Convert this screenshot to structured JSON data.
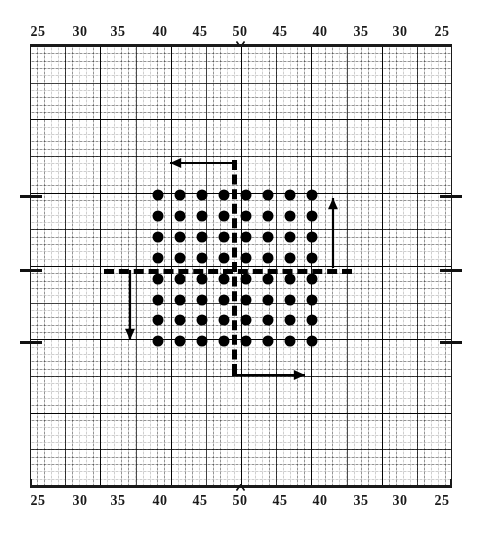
{
  "figure": {
    "title": ""
  },
  "axes": {
    "top": {
      "labels": [
        "25",
        "30",
        "35",
        "40",
        "45",
        "50",
        "45",
        "40",
        "35",
        "30",
        "25"
      ],
      "positions": [
        38,
        80,
        118,
        160,
        200,
        240,
        280,
        320,
        361,
        400,
        442
      ],
      "marker": "caret-down",
      "marker_label": "50"
    },
    "bottom": {
      "labels": [
        "25",
        "30",
        "35",
        "40",
        "45",
        "50",
        "45",
        "40",
        "35",
        "30",
        "25"
      ],
      "positions": [
        38,
        80,
        118,
        160,
        200,
        240,
        280,
        320,
        361,
        400,
        442
      ],
      "marker": "caret-up",
      "marker_label": "50"
    },
    "side_ticks": {
      "count": 3,
      "y_positions": [
        195,
        269,
        341
      ]
    }
  },
  "grid": {
    "left": 30,
    "top": 46,
    "width": 422,
    "height": 440,
    "fine_step_x": 7.033,
    "fine_step_y": 7.333,
    "medium_every": 5,
    "major_every": 10,
    "line_color": "#1a1a1a",
    "background": "#ffffff"
  },
  "crosshair": {
    "vertical_x": 232,
    "vertical_top": 160,
    "vertical_bottom": 374,
    "horizontal_y": 269,
    "horizontal_left": 104,
    "horizontal_right": 352,
    "style": "dashed",
    "color": "#000000",
    "thickness": 5
  },
  "lattice": {
    "rows": 8,
    "cols": 8,
    "dot_diameter": 11,
    "dot_color": "#000000",
    "x_positions": [
      158,
      180,
      202,
      224,
      246,
      268,
      290,
      312
    ],
    "y_positions": [
      195,
      216,
      237,
      258,
      279,
      300,
      320,
      341
    ],
    "total_dots": 64
  },
  "arrows": [
    {
      "name": "arrow-left-top",
      "direction": "left",
      "x1": 232,
      "y1": 163,
      "x2": 170,
      "y2": 163
    },
    {
      "name": "arrow-up-right",
      "direction": "up",
      "x1": 333,
      "y1": 268,
      "x2": 333,
      "y2": 198
    },
    {
      "name": "arrow-down-left",
      "direction": "down",
      "x1": 130,
      "y1": 270,
      "x2": 130,
      "y2": 340
    },
    {
      "name": "arrow-right-bottom",
      "direction": "right",
      "x1": 232,
      "y1": 375,
      "x2": 305,
      "y2": 375
    }
  ],
  "chart_data": {
    "type": "scatter",
    "title": "",
    "xlabel": "",
    "ylabel": "",
    "x_tick_labels": [
      "25",
      "30",
      "35",
      "40",
      "45",
      "50",
      "45",
      "40",
      "35",
      "30",
      "25"
    ],
    "x_tick_labels_bottom": [
      "25",
      "30",
      "35",
      "40",
      "45",
      "50",
      "45",
      "40",
      "35",
      "30",
      "25"
    ],
    "grid": true,
    "legend": "none",
    "series": [
      {
        "name": "lattice-dots",
        "marker": "filled-circle",
        "color": "#000000",
        "points": [
          [
            1,
            1
          ],
          [
            2,
            1
          ],
          [
            3,
            1
          ],
          [
            4,
            1
          ],
          [
            5,
            1
          ],
          [
            6,
            1
          ],
          [
            7,
            1
          ],
          [
            8,
            1
          ],
          [
            1,
            2
          ],
          [
            2,
            2
          ],
          [
            3,
            2
          ],
          [
            4,
            2
          ],
          [
            5,
            2
          ],
          [
            6,
            2
          ],
          [
            7,
            2
          ],
          [
            8,
            2
          ],
          [
            1,
            3
          ],
          [
            2,
            3
          ],
          [
            3,
            3
          ],
          [
            4,
            3
          ],
          [
            5,
            3
          ],
          [
            6,
            3
          ],
          [
            7,
            3
          ],
          [
            8,
            3
          ],
          [
            1,
            4
          ],
          [
            2,
            4
          ],
          [
            3,
            4
          ],
          [
            4,
            4
          ],
          [
            5,
            4
          ],
          [
            6,
            4
          ],
          [
            7,
            4
          ],
          [
            8,
            4
          ],
          [
            1,
            5
          ],
          [
            2,
            5
          ],
          [
            3,
            5
          ],
          [
            4,
            5
          ],
          [
            5,
            5
          ],
          [
            6,
            5
          ],
          [
            7,
            5
          ],
          [
            8,
            5
          ],
          [
            1,
            6
          ],
          [
            2,
            6
          ],
          [
            3,
            6
          ],
          [
            4,
            6
          ],
          [
            5,
            6
          ],
          [
            6,
            6
          ],
          [
            7,
            6
          ],
          [
            8,
            6
          ],
          [
            1,
            7
          ],
          [
            2,
            7
          ],
          [
            3,
            7
          ],
          [
            4,
            7
          ],
          [
            5,
            7
          ],
          [
            6,
            7
          ],
          [
            7,
            7
          ],
          [
            8,
            7
          ],
          [
            1,
            8
          ],
          [
            2,
            8
          ],
          [
            3,
            8
          ],
          [
            4,
            8
          ],
          [
            5,
            8
          ],
          [
            6,
            8
          ],
          [
            7,
            8
          ],
          [
            8,
            8
          ]
        ]
      }
    ],
    "annotations": [
      {
        "type": "arrow",
        "label": "",
        "direction": "left"
      },
      {
        "type": "arrow",
        "label": "",
        "direction": "up"
      },
      {
        "type": "arrow",
        "label": "",
        "direction": "down"
      },
      {
        "type": "arrow",
        "label": "",
        "direction": "right"
      },
      {
        "type": "dashed-line",
        "label": "",
        "orientation": "vertical"
      },
      {
        "type": "dashed-line",
        "label": "",
        "orientation": "horizontal"
      }
    ]
  }
}
